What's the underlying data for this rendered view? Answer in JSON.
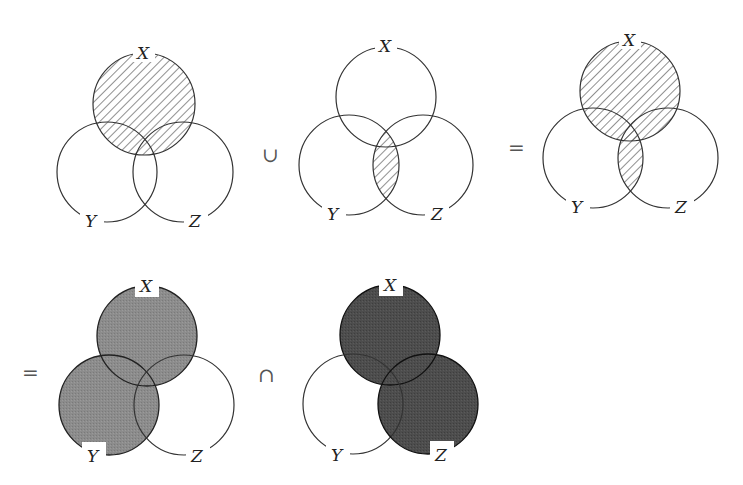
{
  "diagram": {
    "operators": {
      "union": "∪",
      "equals_top": "=",
      "equals_bottom": "=",
      "intersection": "∩"
    },
    "labels": {
      "x": "X",
      "y": "Y",
      "z": "Z"
    },
    "colors": {
      "stroke": "#333333",
      "hatch": "#444444",
      "gray_fill": "#8c8c8c",
      "dark_fill": "#4d4d4d",
      "background": "#ffffff"
    },
    "panels": [
      {
        "id": "x",
        "caption": "X",
        "shaded": "X (hatched)"
      },
      {
        "id": "y-and-z",
        "caption": "Y ∩ Z",
        "shaded": "Y ∩ Z (hatched)"
      },
      {
        "id": "x-or-y-and-z",
        "caption": "X ∪ (Y ∩ Z)",
        "shaded": "X ∪ (Y ∩ Z) (hatched)"
      },
      {
        "id": "x-or-y",
        "caption": "X ∪ Y",
        "shaded": "X ∪ Y (gray)"
      },
      {
        "id": "x-or-z",
        "caption": "X ∪ Z",
        "shaded": "X ∪ Z (dark gray)"
      }
    ]
  }
}
